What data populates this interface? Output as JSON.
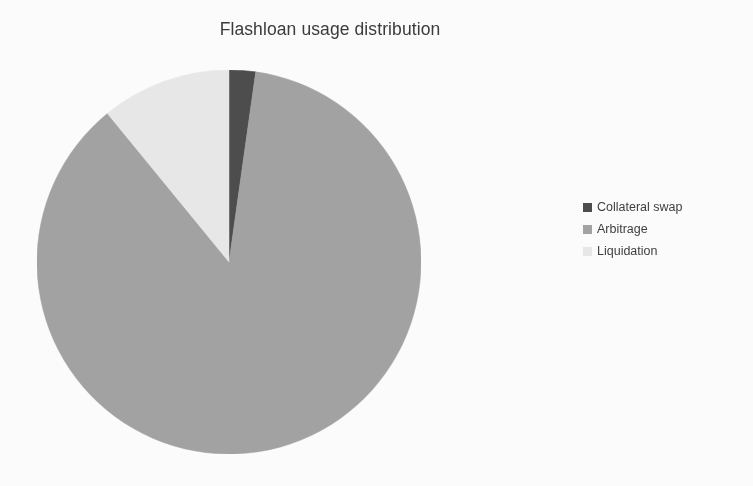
{
  "chart_data": {
    "type": "pie",
    "title": "Flashloan usage distribution",
    "xlabel": "",
    "ylabel": "",
    "legend_position": "right",
    "grid": false,
    "categories": [
      "Collateral swap",
      "Arbitrage",
      "Liquidation"
    ],
    "values": [
      2.2,
      86.9,
      10.9
    ],
    "units": "percent",
    "slices": [
      {
        "label": "Collateral swap",
        "value": 2.2,
        "angle_deg": 8.0,
        "color": "#4d4d4d",
        "start_angle_deg": 352.0,
        "end_angle_deg": 360.0
      },
      {
        "label": "Arbitrage",
        "value": 86.9,
        "angle_deg": 312.7,
        "color": "#a3a3a3",
        "start_angle_deg": 39.3,
        "end_angle_deg": 352.0
      },
      {
        "label": "Liquidation",
        "value": 10.9,
        "angle_deg": 39.3,
        "color": "#e9e9e9",
        "start_angle_deg": 0.0,
        "end_angle_deg": 39.3
      }
    ],
    "start_angle_note": "first slice boundary at 12 o'clock, drawn clockwise",
    "geometry": {
      "center_x": 229,
      "center_y": 262,
      "radius": 192
    }
  },
  "legend": {
    "items": [
      {
        "label": "Collateral swap",
        "color": "#4d4d4d"
      },
      {
        "label": "Arbitrage",
        "color": "#a3a3a3"
      },
      {
        "label": "Liquidation",
        "color": "#e9e9e9"
      }
    ]
  },
  "colors": {
    "background": "#fdfdfd",
    "title_text": "#3b3b3b",
    "legend_text": "#3f3f3f",
    "slice_collateral_swap": "#4d4d4d",
    "slice_arbitrage": "#a3a3a3",
    "slice_liquidation": "#e9e9e9"
  }
}
